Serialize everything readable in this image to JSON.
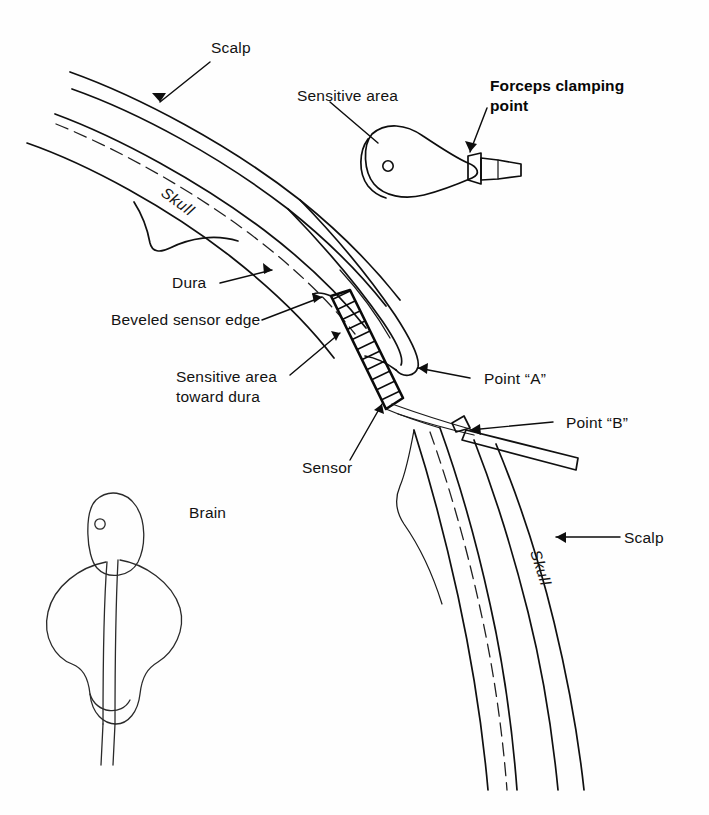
{
  "figure": {
    "background_color": "#fefefe",
    "ink_color": "#101010",
    "width": 709,
    "height": 815
  },
  "labels": {
    "scalp_top": "Scalp",
    "scalp_bottom": "Scalp",
    "skull_top": "Skull",
    "skull_bottom": "Skull",
    "dura": "Dura",
    "beveled_sensor_edge": "Beveled sensor edge",
    "sensitive_area_toward_dura_line1": "Sensitive area",
    "sensitive_area_toward_dura_line2": "toward dura",
    "sensor": "Sensor",
    "brain": "Brain",
    "sensitive_area": "Sensitive area",
    "forceps_clamping_point_line1": "Forceps clamping",
    "forceps_clamping_point_line2": "point",
    "point_a": "Point “A”",
    "point_b": "Point “B”"
  },
  "parts": {
    "scalp_flap": "scalp-flap",
    "skull_bone": "skull-bone",
    "dura_membrane": "dura-membrane",
    "sensor_cross_section": "sensor-cross-section",
    "sensor_plan_view": "sensor-plan-view",
    "sensor_detail_view": "sensor-detail-view",
    "sensor_cable": "sensor-cable"
  }
}
